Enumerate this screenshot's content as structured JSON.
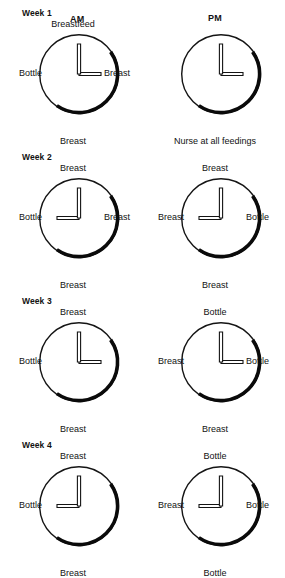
{
  "figure": {
    "type": "diagram",
    "columns": [
      {
        "key": "am",
        "label": "AM"
      },
      {
        "key": "pm",
        "label": "PM"
      }
    ],
    "colors": {
      "ink": "#121212",
      "background": "#ffffff",
      "dial_stroke": "#141414",
      "shadow_arc": "#0a0a0a",
      "hand_fill": "#ffffff",
      "hand_stroke": "#141414"
    },
    "dial": {
      "radius": 40,
      "thin_stroke_width": 1.4,
      "thick_stroke_width": 3.6,
      "shadow_arc_start_deg": 55,
      "shadow_arc_end_deg": 215,
      "minute_hand_direction": "12",
      "minute_hand_length": 30,
      "hour_hand_length": 22
    }
  },
  "weeks": [
    {
      "label": "Week 1",
      "am": {
        "hour_hand": "3",
        "labels": {
          "top": "Breastfeed",
          "left": "Bottle",
          "right": "Breast",
          "bottom": "Breast"
        },
        "caption": ""
      },
      "pm": {
        "hour_hand": "3",
        "labels": {
          "top": "",
          "left": "",
          "right": "",
          "bottom": ""
        },
        "caption": "Nurse at all feedings"
      }
    },
    {
      "label": "Week 2",
      "am": {
        "hour_hand": "9",
        "labels": {
          "top": "Breast",
          "left": "Bottle",
          "right": "Breast",
          "bottom": "Breast"
        },
        "caption": ""
      },
      "pm": {
        "hour_hand": "9",
        "labels": {
          "top": "Breast",
          "left": "Breast",
          "right": "Bottle",
          "bottom": "Breast"
        },
        "caption": ""
      }
    },
    {
      "label": "Week 3",
      "am": {
        "hour_hand": "3",
        "labels": {
          "top": "Breast",
          "left": "Bottle",
          "right": "",
          "bottom": "Breast"
        },
        "caption": ""
      },
      "pm": {
        "hour_hand": "3",
        "labels": {
          "top": "Bottle",
          "left": "Breast",
          "right": "Bottle",
          "bottom": "Breast"
        },
        "caption": ""
      }
    },
    {
      "label": "Week 4",
      "am": {
        "hour_hand": "9",
        "labels": {
          "top": "Breast",
          "left": "Bottle",
          "right": "",
          "bottom": "Breast"
        },
        "caption": ""
      },
      "pm": {
        "hour_hand": "9",
        "labels": {
          "top": "Bottle",
          "left": "Breast",
          "right": "Bottle",
          "bottom": "Bottle"
        },
        "caption": ""
      }
    }
  ]
}
